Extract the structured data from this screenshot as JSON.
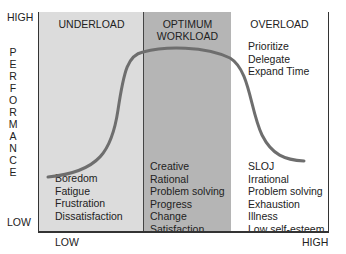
{
  "y_axis": {
    "high": "HIGH",
    "low": "LOW",
    "label_letters": [
      "P",
      "E",
      "R",
      "F",
      "O",
      "R",
      "M",
      "A",
      "N",
      "C",
      "E"
    ]
  },
  "x_axis": {
    "low": "LOW",
    "high": "HIGH"
  },
  "zones": [
    {
      "title": "UNDERLOAD",
      "top_items": [],
      "bottom_items": [
        "Boredom",
        "Fatigue",
        "Frustration",
        "Dissatisfaction"
      ],
      "color": "#dcdcdc"
    },
    {
      "title_lines": [
        "OPTIMUM",
        "WORKLOAD"
      ],
      "bottom_items": [
        "Creative",
        "Rational",
        "Problem solving",
        "Progress",
        "Change",
        "Satisfaction"
      ],
      "color": "#b5b5b5"
    },
    {
      "title": "OVERLOAD",
      "top_items": [
        "Prioritize",
        "Delegate",
        "Expand Time"
      ],
      "bottom_items": [
        "SLOJ",
        "Irrational",
        "Problem solving",
        "Exhaustion",
        "Illness",
        "Low self-esteem"
      ],
      "color": "#ffffff"
    }
  ],
  "curve_color": "#6e6e6e"
}
